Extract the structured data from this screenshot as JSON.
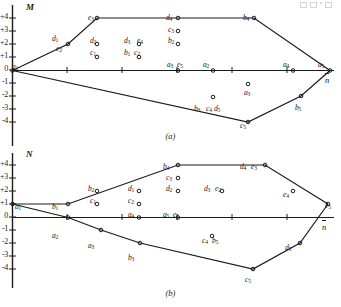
{
  "figure": {
    "panels": [
      {
        "id": "a",
        "caption": "(a)",
        "yaxis_name": "M",
        "xaxis_name": "n",
        "yticks": [
          "+4",
          "+3",
          "+2",
          "+1",
          "0",
          "-1",
          "-2",
          "-3",
          "-4"
        ],
        "labels": [
          {
            "text": "d",
            "sub": "1",
            "x": 52,
            "y": 34
          },
          {
            "text": "e",
            "sub": "2",
            "x": 56,
            "y": 44
          },
          {
            "text": "e",
            "sub": "3",
            "x": 88,
            "y": 13
          },
          {
            "text": "d",
            "sub": "2",
            "x": 90,
            "y": 36
          },
          {
            "text": "c",
            "sub": "1",
            "x": 90,
            "y": 48
          },
          {
            "text": "d",
            "sub": "3",
            "x": 124,
            "y": 36
          },
          {
            "text": "e",
            "sub": "4",
            "x": 137,
            "y": 36
          },
          {
            "text": "b",
            "sub": "1",
            "x": 124,
            "y": 48
          },
          {
            "text": "c",
            "sub": "2",
            "x": 134,
            "y": 48
          },
          {
            "text": "d",
            "sub": "4",
            "x": 166,
            "y": 13
          },
          {
            "text": "c",
            "sub": "3",
            "x": 168,
            "y": 25
          },
          {
            "text": "b",
            "sub": "2",
            "x": 168,
            "y": 36
          },
          {
            "text": "a",
            "sub": "1",
            "x": 12,
            "y": 62
          },
          {
            "text": "a",
            "sub": "3",
            "x": 167,
            "y": 60
          },
          {
            "text": "e",
            "sub": "5",
            "x": 177,
            "y": 60
          },
          {
            "text": "a",
            "sub": "2",
            "x": 203,
            "y": 60
          },
          {
            "text": "b",
            "sub": "4",
            "x": 243,
            "y": 13
          },
          {
            "text": "a",
            "sub": "4",
            "x": 283,
            "y": 60
          },
          {
            "text": "a",
            "sub": "5",
            "x": 318,
            "y": 60
          },
          {
            "text": "a",
            "sub": "3",
            "x": 244,
            "y": 88
          },
          {
            "text": "b",
            "sub": "3",
            "x": 194,
            "y": 104
          },
          {
            "text": "c",
            "sub": "4",
            "x": 206,
            "y": 104
          },
          {
            "text": "d",
            "sub": "5",
            "x": 214,
            "y": 104
          },
          {
            "text": "b",
            "sub": "5",
            "x": 295,
            "y": 103
          },
          {
            "text": "c",
            "sub": "5",
            "x": 240,
            "y": 121
          }
        ]
      },
      {
        "id": "b",
        "caption": "(b)",
        "yaxis_name": "N",
        "xaxis_name": "n",
        "yticks": [
          "+4",
          "+3",
          "+2",
          "+1",
          "0",
          "-1",
          "-2",
          "-3",
          "-4"
        ],
        "labels": [
          {
            "text": "a",
            "sub": "1",
            "x": 15,
            "y": 54
          },
          {
            "text": "b",
            "sub": "1",
            "x": 52,
            "y": 54
          },
          {
            "text": "b",
            "sub": "2",
            "x": 88,
            "y": 36
          },
          {
            "text": "c",
            "sub": "1",
            "x": 90,
            "y": 48
          },
          {
            "text": "d",
            "sub": "1",
            "x": 128,
            "y": 36
          },
          {
            "text": "c",
            "sub": "2",
            "x": 128,
            "y": 48
          },
          {
            "text": "b",
            "sub": "4",
            "x": 163,
            "y": 14
          },
          {
            "text": "c",
            "sub": "3",
            "x": 166,
            "y": 25
          },
          {
            "text": "d",
            "sub": "2",
            "x": 166,
            "y": 36
          },
          {
            "text": "d",
            "sub": "4",
            "x": 240,
            "y": 14
          },
          {
            "text": "e",
            "sub": "3",
            "x": 251,
            "y": 14
          },
          {
            "text": "d",
            "sub": "3",
            "x": 204,
            "y": 36
          },
          {
            "text": "e",
            "sub": "2",
            "x": 215,
            "y": 36
          },
          {
            "text": "e",
            "sub": "4",
            "x": 283,
            "y": 42
          },
          {
            "text": "e",
            "sub": "5",
            "x": 325,
            "y": 53
          },
          {
            "text": "a",
            "sub": "4",
            "x": 128,
            "y": 62
          },
          {
            "text": "a",
            "sub": "5",
            "x": 163,
            "y": 62
          },
          {
            "text": "e",
            "sub": "1",
            "x": 173,
            "y": 62
          },
          {
            "text": "a",
            "sub": "2",
            "x": 52,
            "y": 83
          },
          {
            "text": "a",
            "sub": "3",
            "x": 88,
            "y": 93
          },
          {
            "text": "b",
            "sub": "3",
            "x": 128,
            "y": 105
          },
          {
            "text": "c",
            "sub": "4",
            "x": 202,
            "y": 88
          },
          {
            "text": "b",
            "sub": "5",
            "x": 212,
            "y": 88
          },
          {
            "text": "d",
            "sub": "5",
            "x": 285,
            "y": 95
          },
          {
            "text": "c",
            "sub": "5",
            "x": 245,
            "y": 127
          }
        ]
      }
    ]
  },
  "chart_data": [
    {
      "type": "line",
      "id": "a",
      "title": "(a)",
      "xlabel": "n",
      "ylabel": "M",
      "ylim": [
        -4,
        4.6
      ],
      "xlim": [
        0,
        5.6
      ],
      "grid": false,
      "legend": "none",
      "axis_ticks_y": [
        4,
        3,
        2,
        1,
        0,
        -1,
        -2,
        -3,
        -4
      ],
      "series": [
        {
          "name": "upper-envelope",
          "points": [
            {
              "x": 0,
              "y": 0,
              "label": "a1"
            },
            {
              "x": 1,
              "y": 2,
              "label": "d1"
            },
            {
              "x": 1.5,
              "y": 4,
              "label": "e3"
            },
            {
              "x": 3,
              "y": 4,
              "label": "d4"
            },
            {
              "x": 4.2,
              "y": 4,
              "label": "b4"
            },
            {
              "x": 5.4,
              "y": 0,
              "label": "a5"
            }
          ]
        },
        {
          "name": "lower-envelope",
          "points": [
            {
              "x": 0,
              "y": 0,
              "label": "a1"
            },
            {
              "x": 4.15,
              "y": -4,
              "label": "c5"
            },
            {
              "x": 4.95,
              "y": -2,
              "label": "b5"
            },
            {
              "x": 5.4,
              "y": 0,
              "label": "a5"
            }
          ]
        },
        {
          "name": "baseline",
          "points": [
            {
              "x": 0,
              "y": 0,
              "label": "a1"
            },
            {
              "x": 3.0,
              "y": 0,
              "label": "a3e5"
            },
            {
              "x": 3.65,
              "y": 0,
              "label": "a2"
            },
            {
              "x": 4.9,
              "y": 0,
              "label": "a4"
            },
            {
              "x": 5.4,
              "y": 0,
              "label": "a5"
            }
          ]
        }
      ],
      "scatter": [
        {
          "label": "d1",
          "x": 1.0,
          "y": 2.05
        },
        {
          "label": "e2",
          "x": 1.0,
          "y": 2.05
        },
        {
          "label": "d2",
          "x": 1.55,
          "y": 2.0
        },
        {
          "label": "c1",
          "x": 1.55,
          "y": 1.0
        },
        {
          "label": "d3e4",
          "x": 2.4,
          "y": 2.0
        },
        {
          "label": "b1c2",
          "x": 2.4,
          "y": 1.0
        },
        {
          "label": "c3",
          "x": 3.0,
          "y": 3.0
        },
        {
          "label": "b2",
          "x": 3.0,
          "y": 2.0
        },
        {
          "label": "a3e5",
          "x": 3.0,
          "y": 0.0
        },
        {
          "label": "a2",
          "x": 3.65,
          "y": 0.0
        },
        {
          "label": "a3",
          "x": 4.3,
          "y": -1.1
        },
        {
          "label": "b3c4d5",
          "x": 3.6,
          "y": -1.9
        },
        {
          "label": "a4",
          "x": 4.9,
          "y": 0.0
        },
        {
          "label": "b5",
          "x": 4.95,
          "y": -2.0
        },
        {
          "label": "c5",
          "x": 4.15,
          "y": -4.0
        }
      ]
    },
    {
      "type": "line",
      "id": "b",
      "title": "(b)",
      "xlabel": "n",
      "ylabel": "N",
      "ylim": [
        -4,
        4.6
      ],
      "xlim": [
        0,
        5.6
      ],
      "grid": false,
      "legend": "none",
      "axis_ticks_y": [
        4,
        3,
        2,
        1,
        0,
        -1,
        -2,
        -3,
        -4
      ],
      "series": [
        {
          "name": "upper-envelope",
          "points": [
            {
              "x": 0,
              "y": 1,
              "label": "a1"
            },
            {
              "x": 1.0,
              "y": 1,
              "label": "b1"
            },
            {
              "x": 2.95,
              "y": 4,
              "label": "b4"
            },
            {
              "x": 4.35,
              "y": 4,
              "label": "d4e3"
            },
            {
              "x": 5.45,
              "y": 1,
              "label": "e5"
            }
          ]
        },
        {
          "name": "lower-envelope",
          "points": [
            {
              "x": 0,
              "y": 1,
              "label": "a1"
            },
            {
              "x": 1.0,
              "y": 0,
              "label": "a2"
            },
            {
              "x": 1.6,
              "y": -1,
              "label": "a3"
            },
            {
              "x": 2.35,
              "y": -2,
              "label": "b3"
            },
            {
              "x": 4.25,
              "y": -4,
              "label": "c5"
            },
            {
              "x": 4.95,
              "y": -2,
              "label": "d5"
            },
            {
              "x": 5.45,
              "y": 1,
              "label": "e5"
            }
          ]
        },
        {
          "name": "baseline",
          "points": [
            {
              "x": 0,
              "y": 0,
              "label": "origin"
            },
            {
              "x": 5.6,
              "y": 0,
              "label": "n"
            }
          ]
        }
      ],
      "scatter": [
        {
          "label": "a1",
          "x": 0.0,
          "y": 1.0
        },
        {
          "label": "b1",
          "x": 1.0,
          "y": 1.0
        },
        {
          "label": "b2",
          "x": 1.55,
          "y": 2.0
        },
        {
          "label": "c1",
          "x": 1.55,
          "y": 1.0
        },
        {
          "label": "d1",
          "x": 2.3,
          "y": 2.0
        },
        {
          "label": "c2",
          "x": 2.3,
          "y": 1.0
        },
        {
          "label": "a4",
          "x": 2.3,
          "y": 0.0
        },
        {
          "label": "b4",
          "x": 2.95,
          "y": 4.0
        },
        {
          "label": "c3",
          "x": 2.95,
          "y": 3.0
        },
        {
          "label": "d2",
          "x": 2.95,
          "y": 2.0
        },
        {
          "label": "a5e1",
          "x": 2.95,
          "y": 0.0
        },
        {
          "label": "d3e2",
          "x": 3.7,
          "y": 2.0
        },
        {
          "label": "d4e3",
          "x": 4.35,
          "y": 4.0
        },
        {
          "label": "e4",
          "x": 4.95,
          "y": 2.0
        },
        {
          "label": "e5",
          "x": 5.45,
          "y": 1.0
        },
        {
          "label": "a2",
          "x": 1.0,
          "y": 0.0
        },
        {
          "label": "a3",
          "x": 1.6,
          "y": -1.0
        },
        {
          "label": "b3",
          "x": 2.35,
          "y": -2.0
        },
        {
          "label": "c4b5",
          "x": 3.6,
          "y": -1.55
        },
        {
          "label": "c5",
          "x": 4.25,
          "y": -4.0
        },
        {
          "label": "d5",
          "x": 4.95,
          "y": -2.0
        }
      ]
    }
  ]
}
